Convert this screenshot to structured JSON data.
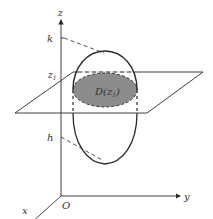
{
  "diagram": {
    "type": "3d-volume-slicing",
    "labels": {
      "z_axis": "z",
      "y_axis": "y",
      "x_axis": "x",
      "origin": "O",
      "upper_bound": "k",
      "lower_bound": "h",
      "slice_level": "z",
      "slice_level_sub": "1",
      "cross_section": "D(z",
      "cross_section_sub": "1",
      "cross_section_close": ")"
    },
    "colors": {
      "line": "#2a2a2a",
      "fill": "#8c8c8c",
      "text": "#333333"
    }
  }
}
